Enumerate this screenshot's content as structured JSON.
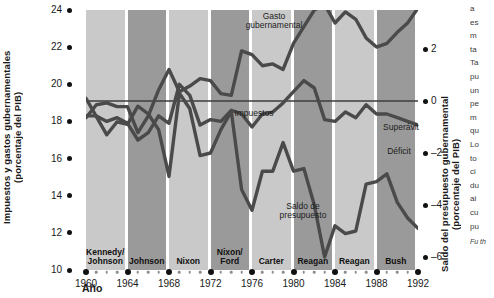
{
  "axes": {
    "y_left_title": "Impuestos y gastos gubernamentales\n(porcentaje del PIB)",
    "y_right_title": "Saldo del presupuesto gubernamental\n(porcentaje del PIB)",
    "x_title": "Año"
  },
  "labels": {
    "gasto": "Gasto\ngubernamental",
    "impuestos": "Impuestos",
    "saldo": "Saldo de\npresupuesto",
    "superavit": "Superávit",
    "deficit": "Déficit"
  },
  "sidenote": {
    "lines": [
      "a",
      "es",
      "m",
      "ta",
      "Ta",
      "pu",
      "un",
      "pe",
      "m",
      "qu",
      "Lo",
      "to",
      "ci",
      "du",
      "ai",
      "cu",
      "pu"
    ],
    "source": "Fu\nth"
  },
  "chart_data": {
    "type": "line",
    "title": "",
    "xlabel": "Año",
    "ylabel": "Impuestos y gastos gubernamentales (porcentaje del PIB)",
    "ylabel_right": "Saldo del presupuesto gubernamental (porcentaje del PIB)",
    "xlim": [
      1960,
      1992
    ],
    "ylim": [
      10,
      24
    ],
    "ylim_right": [
      -6.5,
      3.5
    ],
    "grid": false,
    "legend": "inline-annotations",
    "xticks": [
      1960,
      1964,
      1968,
      1972,
      1976,
      1980,
      1984,
      1988,
      1992
    ],
    "yticks_left": [
      10,
      12,
      14,
      16,
      18,
      20,
      22,
      24
    ],
    "yticks_right": [
      -6,
      -4,
      -2,
      0,
      2
    ],
    "x": [
      1960,
      1961,
      1962,
      1963,
      1964,
      1965,
      1966,
      1967,
      1968,
      1969,
      1970,
      1971,
      1972,
      1973,
      1974,
      1975,
      1976,
      1977,
      1978,
      1979,
      1980,
      1981,
      1982,
      1983,
      1984,
      1985,
      1986,
      1987,
      1988,
      1989,
      1990,
      1991,
      1992
    ],
    "series": [
      {
        "name": "Gasto gubernamental",
        "axis": "left",
        "values": [
          18.2,
          18.9,
          19.0,
          18.8,
          18.8,
          17.4,
          18.3,
          19.7,
          20.8,
          19.6,
          19.9,
          20.3,
          20.2,
          19.5,
          19.4,
          21.8,
          21.6,
          21.0,
          21.1,
          20.8,
          22.2,
          23.1,
          24.0,
          24.3,
          23.3,
          23.9,
          23.5,
          22.5,
          22.0,
          22.2,
          22.8,
          23.3,
          24.1
        ]
      },
      {
        "name": "Impuestos",
        "axis": "left",
        "values": [
          18.3,
          18.3,
          18.0,
          18.2,
          17.9,
          17.0,
          17.4,
          18.3,
          17.9,
          20.0,
          19.4,
          17.8,
          18.1,
          18.0,
          18.6,
          18.4,
          17.7,
          18.4,
          18.5,
          19.0,
          19.6,
          20.2,
          19.8,
          18.1,
          18.0,
          18.5,
          18.2,
          18.9,
          18.4,
          18.4,
          18.2,
          18.0,
          17.8
        ]
      },
      {
        "name": "Saldo de presupuesto",
        "axis": "right",
        "values": [
          0.1,
          -0.6,
          -1.3,
          -0.8,
          -0.9,
          -0.2,
          -0.5,
          -1.1,
          -2.9,
          0.3,
          -0.3,
          -2.1,
          -2.0,
          -1.1,
          -0.4,
          -3.4,
          -4.2,
          -2.7,
          -2.7,
          -1.6,
          -2.7,
          -2.6,
          -4.0,
          -6.0,
          -4.8,
          -5.1,
          -5.0,
          -3.2,
          -3.1,
          -2.8,
          -3.9,
          -4.5,
          -4.9
        ]
      }
    ],
    "zero_line_right": 0,
    "bands": [
      {
        "label": "Kennedy/\nJohnson",
        "start": 1960,
        "end": 1964,
        "shade": "lite"
      },
      {
        "label": "Johnson",
        "start": 1964,
        "end": 1968,
        "shade": "dark"
      },
      {
        "label": "Nixon",
        "start": 1968,
        "end": 1972,
        "shade": "lite"
      },
      {
        "label": "Nixon/\nFord",
        "start": 1972,
        "end": 1976,
        "shade": "dark"
      },
      {
        "label": "Carter",
        "start": 1976,
        "end": 1980,
        "shade": "lite"
      },
      {
        "label": "Reagan",
        "start": 1980,
        "end": 1984,
        "shade": "dark"
      },
      {
        "label": "Reagan",
        "start": 1984,
        "end": 1988,
        "shade": "lite"
      },
      {
        "label": "Bush",
        "start": 1988,
        "end": 1992,
        "shade": "dark"
      }
    ],
    "colors": {
      "line": "#4a4a4a",
      "band_light": "#c9c9c9",
      "band_dark": "#9a9a9a",
      "zero_line": "#3c3c3c"
    }
  }
}
